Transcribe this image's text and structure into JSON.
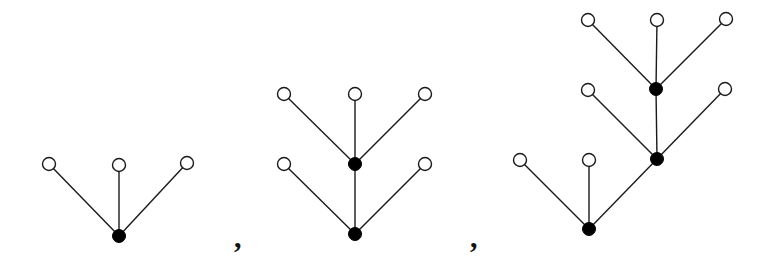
{
  "diagram": {
    "node_radius": 6.5,
    "colors": {
      "edge": "#1a1a1a",
      "open_node_fill": "#ffffff",
      "filled_node_fill": "#000000",
      "background": "#ffffff"
    },
    "separators": [
      {
        "label": ",",
        "x": 234,
        "y": 224
      },
      {
        "label": ",",
        "x": 470,
        "y": 224
      }
    ],
    "trees": [
      {
        "name": "tree-1",
        "nodes": [
          {
            "id": "r",
            "x": 119,
            "y": 236,
            "type": "filled"
          },
          {
            "id": "a",
            "x": 49,
            "y": 164,
            "type": "open"
          },
          {
            "id": "b",
            "x": 119,
            "y": 165,
            "type": "open"
          },
          {
            "id": "c",
            "x": 187,
            "y": 163,
            "type": "open"
          }
        ],
        "edges": [
          [
            "r",
            "a"
          ],
          [
            "r",
            "b"
          ],
          [
            "r",
            "c"
          ]
        ]
      },
      {
        "name": "tree-2",
        "nodes": [
          {
            "id": "r",
            "x": 355,
            "y": 234,
            "type": "filled"
          },
          {
            "id": "m",
            "x": 355,
            "y": 164,
            "type": "filled"
          },
          {
            "id": "l1",
            "x": 284,
            "y": 164,
            "type": "open"
          },
          {
            "id": "r1",
            "x": 425,
            "y": 164,
            "type": "open"
          },
          {
            "id": "t1",
            "x": 284,
            "y": 94,
            "type": "open"
          },
          {
            "id": "t2",
            "x": 355,
            "y": 94,
            "type": "open"
          },
          {
            "id": "t3",
            "x": 425,
            "y": 94,
            "type": "open"
          }
        ],
        "edges": [
          [
            "r",
            "m"
          ],
          [
            "r",
            "l1"
          ],
          [
            "r",
            "r1"
          ],
          [
            "m",
            "t1"
          ],
          [
            "m",
            "t2"
          ],
          [
            "m",
            "t3"
          ]
        ]
      },
      {
        "name": "tree-3",
        "nodes": [
          {
            "id": "r",
            "x": 589,
            "y": 229,
            "type": "filled"
          },
          {
            "id": "m1",
            "x": 657,
            "y": 159,
            "type": "filled"
          },
          {
            "id": "m2",
            "x": 656,
            "y": 89,
            "type": "filled"
          },
          {
            "id": "a",
            "x": 520,
            "y": 160,
            "type": "open"
          },
          {
            "id": "b",
            "x": 589,
            "y": 160,
            "type": "open"
          },
          {
            "id": "c",
            "x": 588,
            "y": 90,
            "type": "open"
          },
          {
            "id": "d",
            "x": 725,
            "y": 89,
            "type": "open"
          },
          {
            "id": "e",
            "x": 588,
            "y": 20,
            "type": "open"
          },
          {
            "id": "f",
            "x": 657,
            "y": 20,
            "type": "open"
          },
          {
            "id": "g",
            "x": 726,
            "y": 19,
            "type": "open"
          }
        ],
        "edges": [
          [
            "r",
            "a"
          ],
          [
            "r",
            "b"
          ],
          [
            "r",
            "m1"
          ],
          [
            "m1",
            "c"
          ],
          [
            "m1",
            "d"
          ],
          [
            "m1",
            "m2"
          ],
          [
            "m2",
            "e"
          ],
          [
            "m2",
            "f"
          ],
          [
            "m2",
            "g"
          ]
        ]
      }
    ]
  }
}
